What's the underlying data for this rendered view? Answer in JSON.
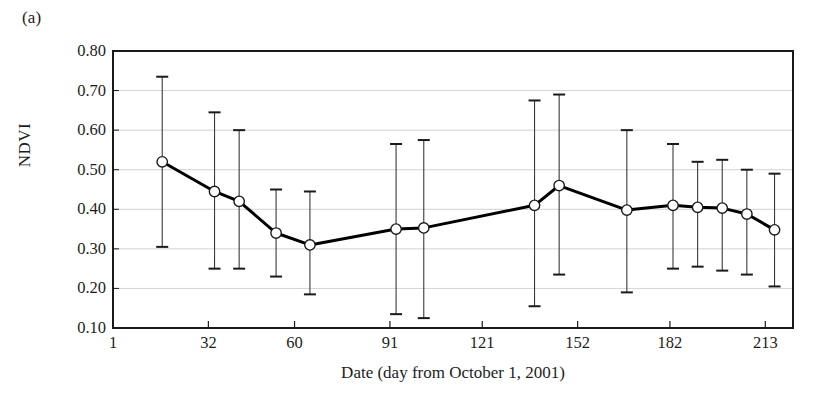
{
  "figure": {
    "panel_label": "(a)",
    "ylabel": "NDVI",
    "xlabel": "Date (day from October 1, 2001)"
  },
  "chart_data": {
    "type": "line",
    "title": "",
    "subtitle": "",
    "xlabel": "Date (day from October 1, 2001)",
    "ylabel": "NDVI",
    "xlim": [
      1,
      222
    ],
    "ylim": [
      0.1,
      0.8
    ],
    "grid": true,
    "legend": null,
    "errorbars": true,
    "marker": "open-circle",
    "line_color": "#000000",
    "grid_color": "#c8c8c8",
    "axis_color": "#1a1a1a",
    "ytick_labels": [
      "0.80",
      "0.70",
      "0.60",
      "0.50",
      "0.40",
      "0.30",
      "0.20",
      "0.10"
    ],
    "ytick_values": [
      0.8,
      0.7,
      0.6,
      0.5,
      0.4,
      0.3,
      0.2,
      0.1
    ],
    "xtick_labels": [
      "1",
      "32",
      "60",
      "91",
      "121",
      "152",
      "182",
      "213"
    ],
    "xtick_values": [
      1,
      32,
      60,
      91,
      121,
      152,
      182,
      213
    ],
    "x": [
      17,
      34,
      42,
      54,
      65,
      93,
      102,
      138,
      146,
      168,
      183,
      191,
      199,
      207,
      216
    ],
    "values": [
      0.52,
      0.445,
      0.42,
      0.34,
      0.31,
      0.35,
      0.353,
      0.41,
      0.46,
      0.398,
      0.41,
      0.405,
      0.403,
      0.388,
      0.348
    ],
    "err_low": [
      0.305,
      0.25,
      0.25,
      0.23,
      0.185,
      0.135,
      0.125,
      0.155,
      0.235,
      0.19,
      0.25,
      0.255,
      0.245,
      0.235,
      0.205
    ],
    "err_high": [
      0.735,
      0.645,
      0.6,
      0.45,
      0.445,
      0.565,
      0.575,
      0.675,
      0.69,
      0.6,
      0.565,
      0.52,
      0.525,
      0.5,
      0.49
    ]
  }
}
